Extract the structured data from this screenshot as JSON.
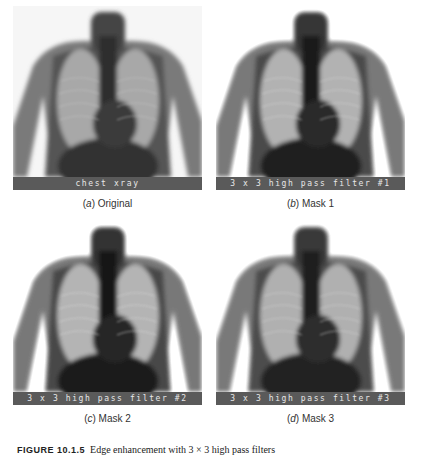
{
  "figure": {
    "panels": [
      {
        "id": "a",
        "overlay_label": "chest xray",
        "letter": "a",
        "caption": "Original",
        "variant": "original"
      },
      {
        "id": "b",
        "overlay_label": "3 x 3 high pass filter #1",
        "letter": "b",
        "caption": "Mask 1",
        "variant": "mask"
      },
      {
        "id": "c",
        "overlay_label": "3 x 3 high pass filter #2",
        "letter": "c",
        "caption": "Mask 2",
        "variant": "mask"
      },
      {
        "id": "d",
        "overlay_label": "3 x 3 high pass filter #3",
        "letter": "d",
        "caption": "Mask 3",
        "variant": "mask"
      }
    ],
    "caption": {
      "label": "FIGURE 10.1.5",
      "text": "Edge enhancement with 3 × 3 high pass filters"
    }
  },
  "colors": {
    "label_bar": "#5a5a5a",
    "label_text": "#e8e8e8",
    "background": "#ffffff"
  }
}
